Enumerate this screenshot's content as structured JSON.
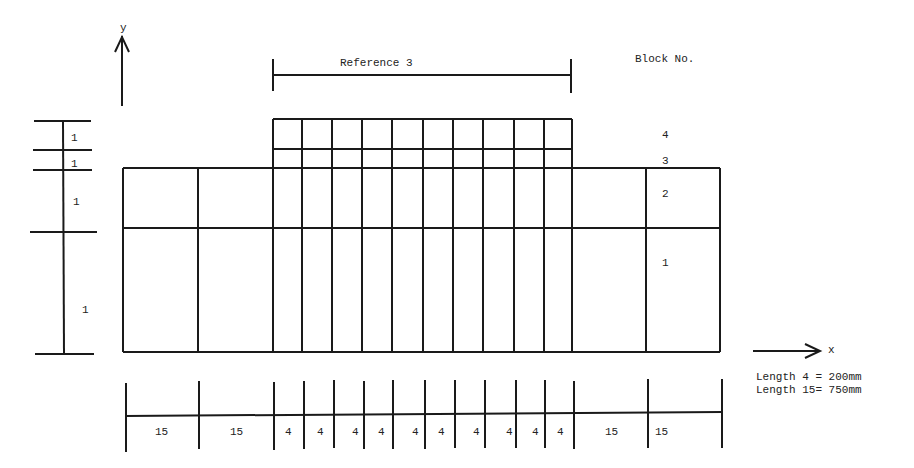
{
  "diagram": {
    "title_reference": "Reference 3",
    "block_header": "Block No.",
    "axis": {
      "y_label": "y",
      "x_label": "x"
    },
    "block_numbers": [
      "4",
      "3",
      "2",
      "1"
    ],
    "left_dimension_labels": [
      "1",
      "1",
      "1",
      "1"
    ],
    "bottom_dimension_labels": [
      "15",
      "15",
      "4",
      "4",
      "4",
      "4",
      "4",
      "4",
      "4",
      "4",
      "4",
      "4",
      "15",
      "15"
    ],
    "legend": {
      "line1": "Length 4 = 200mm",
      "line2": "Length 15= 750mm"
    }
  }
}
